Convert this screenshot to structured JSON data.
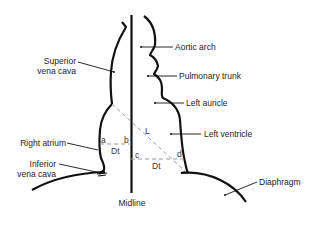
{
  "diagram": {
    "title": "",
    "colors": {
      "line": "#111111",
      "dash": "#9a9a9a",
      "text": "#222222",
      "background": "#ffffff"
    },
    "labels": {
      "superior_vena_cava_1": "Superior",
      "superior_vena_cava_2": "vena cava",
      "right_atrium": "Right atrium",
      "inferior_vena_cava_1": "Inferior",
      "inferior_vena_cava_2": "vena cava",
      "aortic_arch": "Aortic arch",
      "pulmonary_trunk": "Pulmonary trunk",
      "left_auricle": "Left auricle",
      "left_ventricle": "Left ventricle",
      "diaphragm": "Diaphragm",
      "midline": "Midline"
    },
    "measurement_points": {
      "a": "a",
      "b": "b",
      "c": "c",
      "d": "d",
      "L": "L",
      "dt_right": "Dt",
      "dt_left": "Dt"
    }
  }
}
